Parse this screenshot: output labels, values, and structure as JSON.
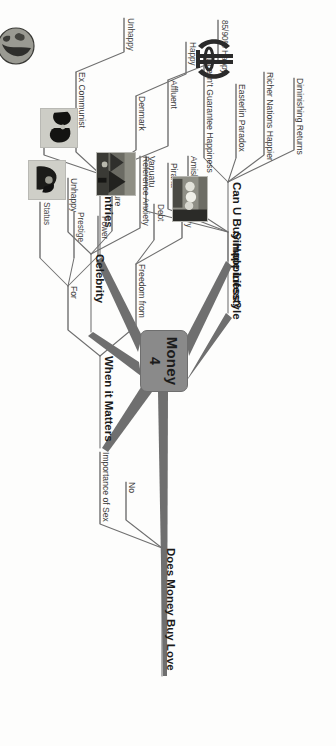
{
  "document": {
    "kind": "mind-map",
    "orientation": "rotated-90-clockwise",
    "background_color": "#fdfdfc",
    "line_color": "#6f6f6f",
    "center_node_color": "#8a8a8a"
  },
  "center": {
    "title": "Money",
    "subtitle": "4"
  },
  "branches": [
    {
      "id": "can-u-buy-happiness",
      "label": "Can U Buy Happiness?",
      "children": [
        {
          "label": "Diminishing Returns"
        },
        {
          "label": "Richer Nations Happier"
        },
        {
          "label": "Easterlin Paradox"
        },
        {
          "label": "Doesn't Guarantee Happiness"
        }
      ]
    },
    {
      "id": "simple-lifestyle",
      "label": "Simple Lifestyle",
      "children": [
        {
          "label": "Amish"
        },
        {
          "label": "Piraha"
        },
        {
          "label": "Vanuatu"
        }
      ]
    },
    {
      "id": "does-money-buy-love",
      "label": "Does Money Buy Love",
      "children": [
        {
          "label": "No"
        },
        {
          "label": "Importance of Sex"
        }
      ]
    },
    {
      "id": "countries",
      "label": "Countries",
      "children": [
        {
          "label": "Affluent",
          "children": [
            {
              "label": "85/90% Happy"
            }
          ]
        },
        {
          "label": "Denmark",
          "children": [
            {
              "label": "Happy"
            }
          ]
        },
        {
          "label": "Ex Communist",
          "children": [
            {
              "label": "Unhappy"
            }
          ]
        },
        {
          "label": "GNH"
        }
      ]
    },
    {
      "id": "celebrity",
      "label": "Celebrity",
      "children": [
        {
          "label": "Reference Anxiety"
        },
        {
          "label": "Pressure"
        },
        {
          "label": "Unhappy"
        }
      ]
    },
    {
      "id": "when-it-matters",
      "label": "When it Matters",
      "children": [
        {
          "label": "Freedom from",
          "children": [
            {
              "label": "Worry"
            },
            {
              "label": "Debt"
            }
          ]
        },
        {
          "label": "For",
          "children": [
            {
              "label": "Power"
            },
            {
              "label": "Prestige"
            },
            {
              "label": "Status"
            }
          ]
        }
      ]
    }
  ],
  "images": [
    {
      "id": "khanda-emblem",
      "name": "khanda-emblem-image"
    },
    {
      "id": "village-photo",
      "name": "village-photo-image"
    },
    {
      "id": "couple-photo",
      "name": "couple-photo-image"
    },
    {
      "id": "globe-photo",
      "name": "globe-earth-image"
    },
    {
      "id": "celebrity-photo",
      "name": "celebrity-group-photo-image"
    },
    {
      "id": "dark-photo",
      "name": "dark-silhouette-image"
    }
  ],
  "labels": {
    "l0_0": "Can U Buy Happiness?",
    "l0_1": "Simple Lifestyle",
    "l0_2": "Does Money Buy Love",
    "l0_3": "Countries",
    "l0_4": "Celebrity",
    "l0_5": "When it Matters",
    "a0": "Diminishing Returns",
    "a1": "Richer Nations Happier",
    "a2": "Easterlin Paradox",
    "a3": "Doesn't Guarantee Happiness",
    "b0": "Amish",
    "b1": "Piraha",
    "b2": "Vanuatu",
    "c0": "No",
    "c1": "Importance of Sex",
    "d0": "Affluent",
    "d1": "Denmark",
    "d2": "Ex Communist",
    "d3": "GNH",
    "d0a": "85/90% Happy",
    "d1a": "Happy",
    "d2a": "Unhappy",
    "e0": "Reference Anxiety",
    "e1": "Pressure",
    "e2": "Unhappy",
    "f0": "Freedom from",
    "f1": "For",
    "f0a": "Worry",
    "f0b": "Debt",
    "f1a": "Power",
    "f1b": "Prestige",
    "f1c": "Status"
  }
}
